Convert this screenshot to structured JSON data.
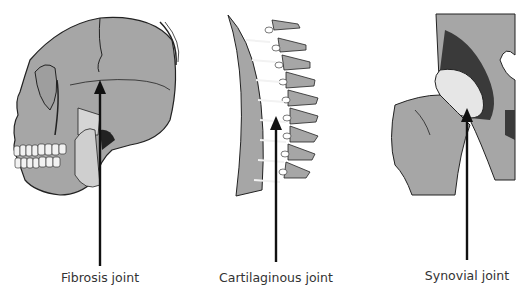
{
  "diagram": {
    "colors": {
      "bone": "#a6a6a6",
      "outline": "#222222",
      "dark": "#3a3a3a",
      "cartilage": "#e6e6e6",
      "arrow": "#111111",
      "label": "#333333"
    },
    "panels": [
      {
        "id": "skull",
        "label": "Fibrosis joint",
        "arrow_x": 100,
        "arrow_tip_y": 82,
        "arrow_base_y": 266
      },
      {
        "id": "spine",
        "label": "Cartilaginous joint",
        "arrow_x": 276,
        "arrow_tip_y": 118,
        "arrow_base_y": 262
      },
      {
        "id": "hip",
        "label": "Synovial joint",
        "arrow_x": 467,
        "arrow_tip_y": 110,
        "arrow_base_y": 260
      }
    ]
  }
}
